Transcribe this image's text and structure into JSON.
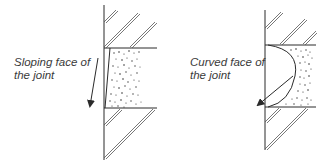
{
  "diagram": {
    "panels": [
      {
        "id": "sloping",
        "label_lines": [
          "Sloping face of",
          "the joint"
        ],
        "joint_shape": "sloping"
      },
      {
        "id": "curved",
        "label_lines": [
          "Curved face of",
          "the joint"
        ],
        "joint_shape": "curved"
      }
    ],
    "colors": {
      "line": "#2a2a2a",
      "hatch": "#555555",
      "text": "#3a3a3a",
      "background": "#ffffff"
    }
  }
}
